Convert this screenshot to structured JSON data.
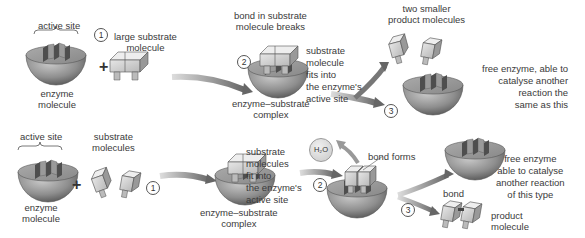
{
  "top_row": {
    "active_site": "active site",
    "step1": "1",
    "large_substrate_line1": "large substrate",
    "large_substrate_line2": "molecule",
    "plus": "+",
    "enzyme_line1": "enzyme",
    "enzyme_line2": "molecule",
    "bond_breaks_line1": "bond in substrate",
    "bond_breaks_line2": "molecule breaks",
    "step2": "2",
    "fits_lines": [
      "substrate",
      "molecule",
      "fits into",
      "the enzyme's",
      "active site"
    ],
    "complex_line1": "enzyme–substrate",
    "complex_line2": "complex",
    "products_line1": "two smaller",
    "products_line2": "product molecules",
    "step3": "3",
    "free_enzyme_lines": [
      "free enzyme, able to",
      "catalyse another",
      "reaction the",
      "same as this"
    ]
  },
  "bottom_row": {
    "active_site": "active site",
    "substrates_line1": "substrate",
    "substrates_line2": "molecules",
    "plus": "+",
    "enzyme_line1": "enzyme",
    "enzyme_line2": "molecule",
    "step1": "1",
    "fits_lines": [
      "substrate",
      "molecules",
      "fit into",
      "the enzyme's",
      "active site"
    ],
    "complex_line1": "enzyme–substrate",
    "complex_line2": "complex",
    "water": "H₂O",
    "step2": "2",
    "bond_forms": "bond forms",
    "step3": "3",
    "free_enzyme_lines": [
      "free enzyme",
      "able to catalyse",
      "another reaction",
      "of this type"
    ],
    "bond": "bond",
    "product_line1": "product",
    "product_line2": "molecule"
  },
  "colors": {
    "enzyme_light": "#b5b5b5",
    "enzyme_dark": "#6a6a6a",
    "substrate": "#d0d0d0",
    "arrow": "#777777",
    "text": "#3a3a3a"
  }
}
